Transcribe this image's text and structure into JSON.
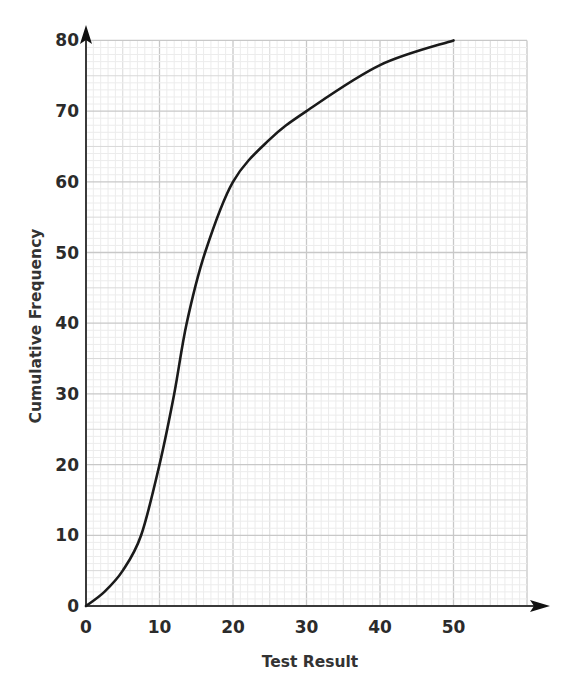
{
  "chart_data": {
    "type": "line",
    "title": "",
    "xlabel": "Test Result",
    "ylabel": "Cumulative Frequency",
    "xlim": [
      0,
      60
    ],
    "ylim": [
      0,
      80
    ],
    "x_ticks": [
      "0",
      "10",
      "20",
      "30",
      "40",
      "50"
    ],
    "y_ticks": [
      "0",
      "10",
      "20",
      "30",
      "40",
      "50",
      "60",
      "70",
      "80"
    ],
    "grid": true,
    "legend": null,
    "series": [
      {
        "name": "Cumulative frequency curve",
        "x": [
          0,
          2.5,
          5,
          7.5,
          10,
          12,
          13.7,
          16.2,
          20,
          25,
          30,
          40,
          50
        ],
        "values": [
          0,
          2,
          5,
          10,
          20,
          30,
          40,
          50,
          60,
          66,
          70,
          76.5,
          80
        ]
      }
    ]
  },
  "colors": {
    "curve": "#1a1a1a",
    "axis": "#333333",
    "grid_major": "#c8c8c8",
    "grid_mid": "#d8d8d8",
    "grid_minor": "#ececec"
  }
}
